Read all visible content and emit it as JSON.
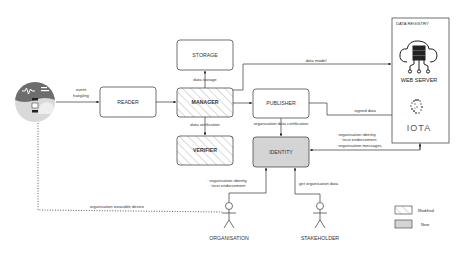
{
  "diagram": {
    "nodes": {
      "device": {
        "label": "",
        "icon": "wearable-device-icon"
      },
      "reader": {
        "label": "READER"
      },
      "manager": {
        "label": "MANAGER",
        "status": "Modified"
      },
      "storage": {
        "label": "STORAGE"
      },
      "verifier": {
        "label": "VERIFIER",
        "status": "Modified"
      },
      "publisher": {
        "label": "PUBLISHER"
      },
      "identity": {
        "label": "IDENTITY",
        "status": "New"
      },
      "data_registry": {
        "label": "DATA REGISTRY",
        "web_server_label": "WEB SERVER",
        "iota_label": "IOTA"
      },
      "organisation": {
        "label": "ORGANISATION"
      },
      "stakeholder": {
        "label": "STAKEHOLDER"
      }
    },
    "edges": {
      "event_handling_1": "event",
      "event_handling_2": "hangling",
      "data_storage": "data storage",
      "data_verification": "data verification",
      "data_model": "data model",
      "signed_data": "signed data",
      "org_data_certification": "organisation data certification",
      "registry_to_identity": [
        "· organisation identity",
        "· trust endorsement",
        "· organisation messages"
      ],
      "org_to_identity": [
        "· organisation identity",
        "· trust endorsement"
      ],
      "get_org_data": "get organisation data",
      "org_wearable_device": "organisation wearable device"
    },
    "legend": {
      "modified": "Modified",
      "new": "New"
    },
    "colors": {
      "line": "#333333",
      "new_fill": "#d4d4d4",
      "hatch": "#b0b0b0",
      "device_dark": "#6b6b6b",
      "device_light": "#d8d8d8"
    }
  }
}
